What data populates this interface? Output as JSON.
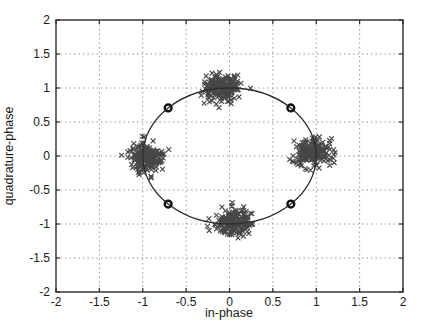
{
  "figure": {
    "background": "#ffffff",
    "kind": "matlab-style-constellation-plot"
  },
  "chart_data": {
    "type": "scatter",
    "title": "",
    "xlabel": "in-phase",
    "ylabel": "quadrature-phase",
    "xlim": [
      -2,
      2
    ],
    "ylim": [
      -2,
      2
    ],
    "xticks": [
      -2,
      -1.5,
      -1,
      -0.5,
      0,
      0.5,
      1,
      1.5,
      2
    ],
    "yticks": [
      -2,
      -1.5,
      -1,
      -0.5,
      0,
      0.5,
      1,
      1.5,
      2
    ],
    "xtick_labels": [
      "-2",
      "-1.5",
      "-1",
      "-0.5",
      "0",
      "0.5",
      "1",
      "1.5",
      "2"
    ],
    "ytick_labels": [
      "-2",
      "-1.5",
      "-1",
      "-0.5",
      "0",
      "0.5",
      "1",
      "1.5",
      "2"
    ],
    "grid": "dotted",
    "legend": "none",
    "unit_circle": {
      "center": [
        0,
        0
      ],
      "radius": 1
    },
    "reference_points": {
      "marker": "o",
      "description": "decision/reference constellation points on unit circle",
      "points": [
        [
          0.707,
          0.707
        ],
        [
          -0.707,
          0.707
        ],
        [
          -0.707,
          -0.707
        ],
        [
          0.707,
          -0.707
        ]
      ]
    },
    "clusters": {
      "marker": "x",
      "description": "received noisy QPSK symbols, gaussian scatter around ideal points",
      "n_per_cluster": 200,
      "sigma": 0.1,
      "max_dev": 0.33,
      "centers": [
        {
          "name": "top",
          "cx": -0.08,
          "cy": 1.0,
          "seed": 101
        },
        {
          "name": "left",
          "cx": -0.97,
          "cy": -0.02,
          "seed": 202
        },
        {
          "name": "right",
          "cx": 0.97,
          "cy": 0.05,
          "seed": 303
        },
        {
          "name": "bottom",
          "cx": 0.05,
          "cy": -0.98,
          "seed": 404
        }
      ]
    },
    "colors": {
      "marker": "#2e2e2e",
      "reference_marker": "#111111",
      "circle_line": "#2a2a2a",
      "grid_line": "#9a9a9a",
      "axis_box": "#2a2a2a",
      "text": "#1a1a1a"
    }
  }
}
